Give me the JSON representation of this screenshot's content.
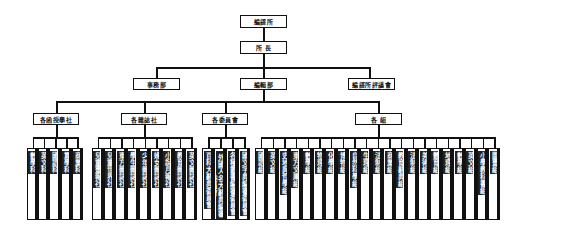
{
  "chart_data": {
    "type": "org-chart",
    "title": "",
    "root": {
      "label": "編譯所",
      "children": [
        {
          "label": "所 長",
          "children": [
            {
              "label": "事務部"
            },
            {
              "label": "編輯部",
              "children": [
                {
                  "label": "各函授學社",
                  "children": [
                    "數學科",
                    "英文科",
                    "國語科",
                    "算學科",
                    "商業科"
                  ]
                },
                {
                  "label": "各雜誌社",
                  "children": [
                    "兒童畫報社",
                    "兒童世界社",
                    "東方雜誌社",
                    "學生雜誌社",
                    "少年雜誌社",
                    "婦女雜誌社",
                    "小說月報社",
                    "教育雜誌社",
                    "英文雜誌社"
                  ]
                },
                {
                  "label": "各委員會",
                  "children": [
                    "百科大辭典委員會",
                    "外國人名大辭典編審委員會",
                    "各種叢書編審委員會",
                    "國文字典編審委員會"
                  ]
                },
                {
                  "label": "各 組",
                  "children": [
                    "國語組",
                    "英文組",
                    "史地與哲學組",
                    "東方文庫組",
                    "數學組",
                    "物理組",
                    "化學組",
                    "博物組",
                    "自然科學組",
                    "生理組",
                    "法制組",
                    "商業組",
                    "教育辭典組",
                    "法制組",
                    "美術組",
                    "體育組",
                    "地理組",
                    "數學組",
                    "英文組",
                    "小學教科書組",
                    "圖畫組"
                  ]
                }
              ]
            },
            {
              "label": "編譯所評議會"
            }
          ]
        }
      ]
    }
  },
  "nodes": {
    "root": "編譯所",
    "head": "所 長",
    "dept_affairs": "事務部",
    "dept_editorial": "編輯部",
    "dept_council": "編譯所評議會",
    "groups": [
      "各函授學社",
      "各雜誌社",
      "各委員會",
      "各 組"
    ]
  },
  "leaves": {
    "g1": [
      "數學科",
      "英文科",
      "國語科",
      "算學科",
      "商業科"
    ],
    "g2": [
      "兒童畫報社",
      "兒童世界社",
      "東方雜誌社",
      "學生雜誌社",
      "少年雜誌社",
      "婦女雜誌社",
      "小說月報社",
      "教育雜誌社",
      "英文雜誌社"
    ],
    "g3": [
      "百科大辭典委員會",
      "外國人名大辭典編審委員會",
      "各種叢書編審委員會",
      "國文字典編審委員會"
    ],
    "g4": [
      "國語組",
      "英文組",
      "史地與哲學組",
      "東方文庫組",
      "數學組",
      "物理組",
      "化學組",
      "博物組",
      "自然科學組",
      "生理組",
      "法制組",
      "商業組",
      "教育辭典組",
      "法制組",
      "美術組",
      "體育組",
      "地理組",
      "數學組",
      "英文組",
      "小學教科書組",
      "圖畫組"
    ]
  }
}
